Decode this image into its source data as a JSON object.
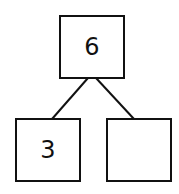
{
  "diagram": {
    "type": "number-bond",
    "whole": "6",
    "parts": [
      "3",
      ""
    ],
    "line_color": "#111111"
  }
}
